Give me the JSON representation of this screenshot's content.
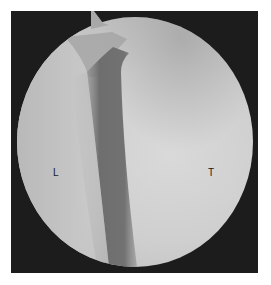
{
  "image": {
    "description": "Arthroscopic circular view with dark diagonal band",
    "labels": {
      "left": "L",
      "right": "T"
    },
    "colors": {
      "frame": "#1c1c1c",
      "field_light": "#d2d2d2",
      "field_mid": "#bdbdbd",
      "band": "#7a7a7a",
      "text": "#1a1a1a"
    }
  }
}
